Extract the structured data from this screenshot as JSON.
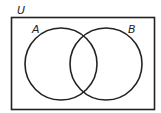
{
  "diagram": {
    "type": "venn",
    "universe_label": "U",
    "sets": [
      {
        "label": "A",
        "cx": 61,
        "cy": 64,
        "r": 36
      },
      {
        "label": "B",
        "cx": 106,
        "cy": 64,
        "r": 36
      }
    ],
    "colors": {
      "stroke": "#222222",
      "background": "#ffffff"
    }
  }
}
